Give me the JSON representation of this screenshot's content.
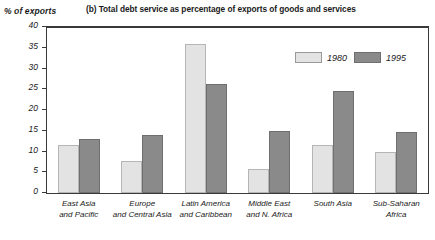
{
  "chart_data": {
    "type": "bar",
    "title": "(b) Total debt service as percentage of exports of goods and services",
    "xlabel": "",
    "ylabel": "% of exports",
    "ylim": [
      0,
      40
    ],
    "yticks": [
      0,
      5,
      10,
      15,
      20,
      25,
      30,
      35,
      40
    ],
    "grid": false,
    "legend_position": "top-right",
    "categories": [
      "East Asia\nand Pacific",
      "Europe\nand Central Asia",
      "Latin America\nand Caribbean",
      "Middle East\nand N. Africa",
      "South Asia",
      "Sub-Saharan\nAfrica"
    ],
    "series": [
      {
        "name": "1980",
        "color": "#e3e3e3",
        "values": [
          11.6,
          7.8,
          36.0,
          5.8,
          11.5,
          10.0
        ]
      },
      {
        "name": "1995",
        "color": "#8a8a8a",
        "values": [
          13.0,
          14.0,
          26.3,
          15.0,
          24.6,
          14.6
        ]
      }
    ]
  },
  "colors": {
    "series_1980": "#e3e3e3",
    "series_1995": "#8a8a8a",
    "axis": "#3a3a3a",
    "background": "#ffffff"
  }
}
